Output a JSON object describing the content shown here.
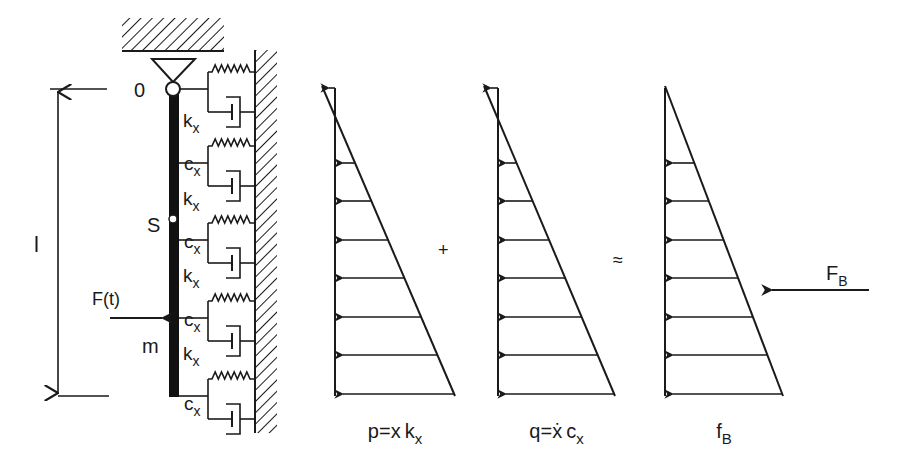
{
  "figure": {
    "labels": {
      "pivot": "0",
      "length": "l",
      "center": "S",
      "force": "F(t)",
      "mass": "m",
      "stiffness": "k",
      "stiffness_sub": "x",
      "damping": "c",
      "damping_sub": "x"
    },
    "beam_model": {
      "spring_damper_branches_y": [
        89,
        163,
        240,
        318,
        396
      ],
      "stiffness_label_y": [
        127,
        205,
        282,
        360
      ],
      "damping_label_y": [
        170,
        248,
        326,
        410
      ]
    },
    "distributions": [
      {
        "id": "stiffness-load",
        "caption_main": "p=x",
        "caption_var": "k",
        "caption_sub": "x",
        "x0": 335,
        "x_bottom": 455,
        "x_top": 322
      },
      {
        "id": "damping-load",
        "caption_main": "q=",
        "caption_dot_var": "x",
        "caption_var": "c",
        "caption_sub": "x",
        "x0": 498,
        "x_bottom": 615,
        "x_top": 484
      },
      {
        "id": "bedding-load",
        "caption_var": "f",
        "caption_sub": "B",
        "x0": 665,
        "x_bottom": 783,
        "x_top": 665
      }
    ],
    "operators": {
      "plus": "+",
      "approx": "≈"
    },
    "resultant": {
      "label": "F",
      "sub": "B"
    },
    "arrow_rows_y": [
      163,
      201,
      240,
      278,
      317,
      355,
      394
    ]
  }
}
